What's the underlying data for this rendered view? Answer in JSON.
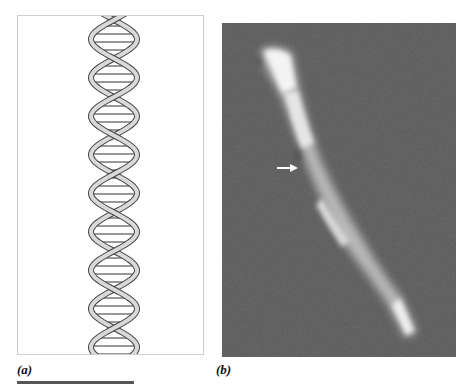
{
  "figure": {
    "panels": [
      {
        "id": "a",
        "label": "(a)",
        "content": "schematic-dna-double-helix"
      },
      {
        "id": "b",
        "label": "(b)",
        "content": "microscopy-image-of-fiber",
        "annotation": "white-arrow-pointing-right"
      }
    ],
    "scale_bar": {
      "visible": true,
      "color": "#555555"
    },
    "colors": {
      "helix_strand_fill": "#d9d9d9",
      "helix_outline": "#444444",
      "micrograph_background": "#5b5b5b",
      "fiber_highlight": "#f2f2f2",
      "arrow": "#ffffff"
    }
  }
}
